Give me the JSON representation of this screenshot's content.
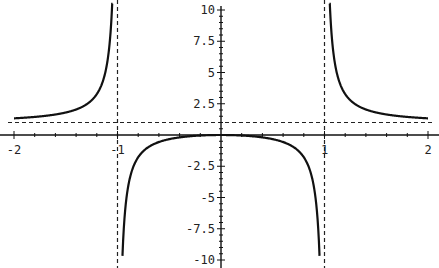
{
  "chart_data": {
    "type": "line",
    "title": "",
    "function": "y = x^2/(x^2 - 1)",
    "xlabel": "",
    "ylabel": "",
    "xlim": [
      -2,
      2
    ],
    "ylim": [
      -10,
      10
    ],
    "x_ticks": [
      -2,
      -1,
      1,
      2
    ],
    "x_tick_labels": [
      "-2",
      "-1",
      "1",
      "2"
    ],
    "y_ticks": [
      10,
      7.5,
      5,
      2.5,
      -2.5,
      -5,
      -7.5,
      -10
    ],
    "y_tick_labels": [
      "10",
      "7.5",
      "5",
      "2.5",
      "-2.5",
      "-5",
      "-7.5",
      "-10"
    ],
    "asymptotes": {
      "vertical": [
        -1,
        1
      ],
      "horizontal": [
        1
      ],
      "style": "dashed"
    },
    "series": [
      {
        "name": "f(x)",
        "x": [
          -2,
          -1.75,
          -1.5,
          -1.25,
          -1.1,
          -1.05,
          -0.95,
          -0.9,
          -0.75,
          -0.5,
          -0.25,
          0,
          0.25,
          0.5,
          0.75,
          0.9,
          0.95,
          1.05,
          1.1,
          1.25,
          1.5,
          1.75,
          2
        ],
        "values": [
          1.33,
          1.48,
          1.8,
          2.78,
          5.76,
          10.76,
          -9.26,
          -4.26,
          -1.29,
          -0.33,
          -0.07,
          0,
          -0.07,
          -0.33,
          -1.29,
          -4.26,
          -9.26,
          10.76,
          5.76,
          2.78,
          1.8,
          1.48,
          1.33
        ]
      }
    ],
    "grid": false,
    "legend": null
  }
}
